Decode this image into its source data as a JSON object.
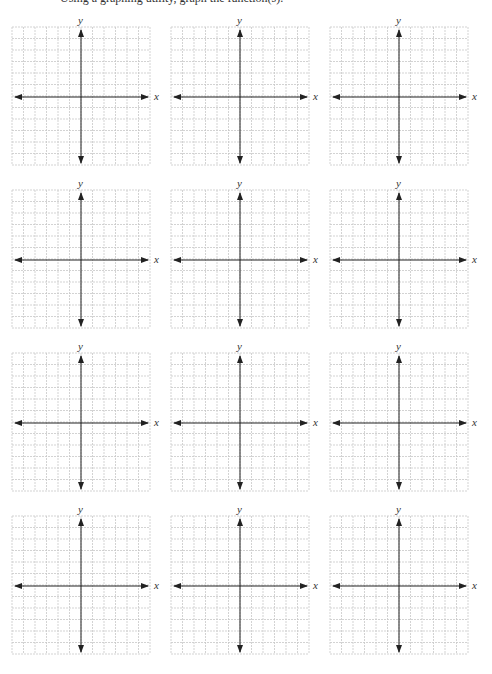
{
  "page": {
    "top_text": "Using a graphing utility, graph the function(s)."
  },
  "grid_style": {
    "cells": 12,
    "grid_color": "#c8c8c8",
    "axis_color": "#222222",
    "background": "#ffffff"
  },
  "graphs": [
    {
      "id": 1,
      "x_label": "x",
      "y_label": "y",
      "left": 12,
      "top": 27
    },
    {
      "id": 2,
      "x_label": "x",
      "y_label": "y",
      "left": 171,
      "top": 27
    },
    {
      "id": 3,
      "x_label": "x",
      "y_label": "y",
      "left": 330,
      "top": 27
    },
    {
      "id": 4,
      "x_label": "x",
      "y_label": "y",
      "left": 12,
      "top": 190
    },
    {
      "id": 5,
      "x_label": "x",
      "y_label": "y",
      "left": 171,
      "top": 190
    },
    {
      "id": 6,
      "x_label": "x",
      "y_label": "y",
      "left": 330,
      "top": 190
    },
    {
      "id": 7,
      "x_label": "x",
      "y_label": "y",
      "left": 12,
      "top": 353
    },
    {
      "id": 8,
      "x_label": "x",
      "y_label": "y",
      "left": 171,
      "top": 353
    },
    {
      "id": 9,
      "x_label": "x",
      "y_label": "y",
      "left": 330,
      "top": 353
    },
    {
      "id": 10,
      "x_label": "x",
      "y_label": "y",
      "left": 12,
      "top": 516
    },
    {
      "id": 11,
      "x_label": "x",
      "y_label": "y",
      "left": 171,
      "top": 516
    },
    {
      "id": 12,
      "x_label": "x",
      "y_label": "y",
      "left": 330,
      "top": 516
    }
  ]
}
